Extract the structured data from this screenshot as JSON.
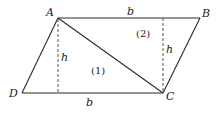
{
  "diagram": {
    "vertices": {
      "A": {
        "label": "A",
        "x": 58,
        "y": 18
      },
      "B": {
        "label": "B",
        "x": 200,
        "y": 18
      },
      "C": {
        "label": "C",
        "x": 163,
        "y": 93
      },
      "D": {
        "label": "D",
        "x": 22,
        "y": 93
      }
    },
    "labels": {
      "A": "A",
      "B": "B",
      "C": "C",
      "D": "D",
      "top_base": "b",
      "bottom_base": "b",
      "height_left": "h",
      "height_right": "h",
      "region_1": "(1)",
      "region_2": "(2)"
    },
    "colors": {
      "line": "#2a2a2a",
      "dashed": "#555555",
      "background": "#ffffff"
    }
  }
}
